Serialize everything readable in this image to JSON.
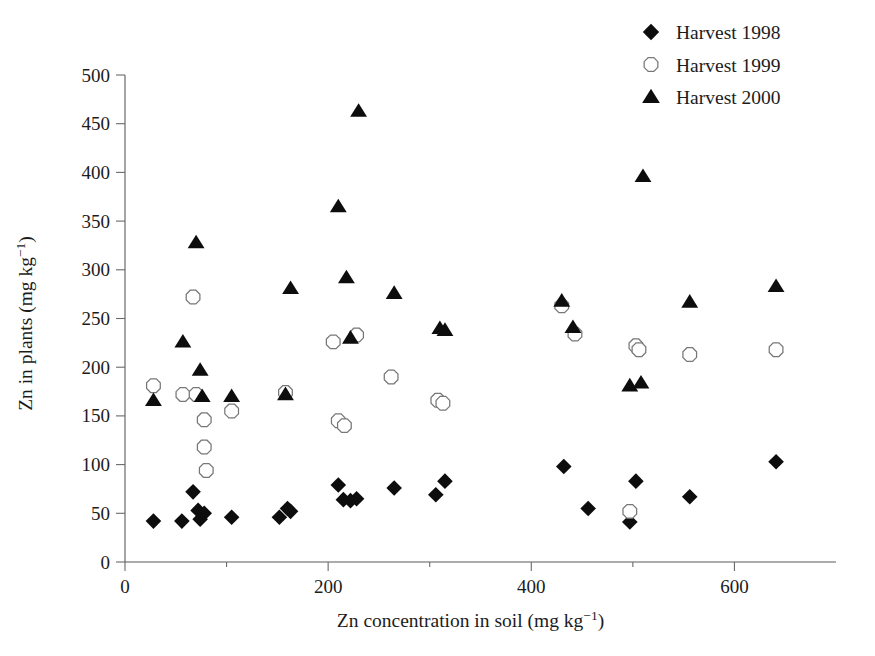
{
  "chart_data": {
    "type": "scatter",
    "title": "",
    "xlabel": "Zn concentration in soil (mg kg⁻¹)",
    "ylabel": "Zn in plants (mg kg⁻¹)",
    "xlim": [
      0,
      700
    ],
    "ylim": [
      0,
      500
    ],
    "xticks": [
      0,
      200,
      400,
      600
    ],
    "xtick_labels": [
      "0",
      "200",
      "400",
      "600"
    ],
    "xminor_ticks": [
      100,
      300,
      500
    ],
    "yticks": [
      0,
      50,
      100,
      150,
      200,
      250,
      300,
      350,
      400,
      450,
      500
    ],
    "ytick_labels": [
      "0",
      "50",
      "100",
      "150",
      "200",
      "250",
      "300",
      "350",
      "400",
      "450",
      "500"
    ],
    "grid": false,
    "legend_position": "top-right",
    "series": [
      {
        "name": "Harvest 1998",
        "marker": "filled-diamond",
        "color": "#0d0d0d",
        "points": [
          {
            "x": 28,
            "y": 42
          },
          {
            "x": 56,
            "y": 42
          },
          {
            "x": 67,
            "y": 72
          },
          {
            "x": 72,
            "y": 53
          },
          {
            "x": 74,
            "y": 44
          },
          {
            "x": 78,
            "y": 50
          },
          {
            "x": 105,
            "y": 46
          },
          {
            "x": 152,
            "y": 46
          },
          {
            "x": 160,
            "y": 55
          },
          {
            "x": 163,
            "y": 52
          },
          {
            "x": 210,
            "y": 79
          },
          {
            "x": 215,
            "y": 64
          },
          {
            "x": 222,
            "y": 63
          },
          {
            "x": 228,
            "y": 65
          },
          {
            "x": 265,
            "y": 76
          },
          {
            "x": 306,
            "y": 69
          },
          {
            "x": 315,
            "y": 83
          },
          {
            "x": 432,
            "y": 98
          },
          {
            "x": 456,
            "y": 55
          },
          {
            "x": 497,
            "y": 41
          },
          {
            "x": 503,
            "y": 83
          },
          {
            "x": 556,
            "y": 67
          },
          {
            "x": 641,
            "y": 103
          }
        ]
      },
      {
        "name": "Harvest 1999",
        "marker": "open-hexagon",
        "color": "#ffffff",
        "points": [
          {
            "x": 28,
            "y": 181
          },
          {
            "x": 57,
            "y": 172
          },
          {
            "x": 67,
            "y": 272
          },
          {
            "x": 70,
            "y": 172
          },
          {
            "x": 78,
            "y": 146
          },
          {
            "x": 78,
            "y": 118
          },
          {
            "x": 80,
            "y": 94
          },
          {
            "x": 105,
            "y": 155
          },
          {
            "x": 158,
            "y": 174
          },
          {
            "x": 205,
            "y": 226
          },
          {
            "x": 210,
            "y": 145
          },
          {
            "x": 216,
            "y": 140
          },
          {
            "x": 228,
            "y": 233
          },
          {
            "x": 262,
            "y": 190
          },
          {
            "x": 308,
            "y": 166
          },
          {
            "x": 313,
            "y": 163
          },
          {
            "x": 430,
            "y": 263
          },
          {
            "x": 443,
            "y": 234
          },
          {
            "x": 497,
            "y": 52
          },
          {
            "x": 503,
            "y": 222
          },
          {
            "x": 506,
            "y": 218
          },
          {
            "x": 556,
            "y": 213
          },
          {
            "x": 641,
            "y": 218
          }
        ]
      },
      {
        "name": "Harvest 2000",
        "marker": "filled-triangle",
        "color": "#0d0d0d",
        "points": [
          {
            "x": 28,
            "y": 166
          },
          {
            "x": 57,
            "y": 226
          },
          {
            "x": 70,
            "y": 328
          },
          {
            "x": 74,
            "y": 197
          },
          {
            "x": 76,
            "y": 170
          },
          {
            "x": 105,
            "y": 170
          },
          {
            "x": 158,
            "y": 172
          },
          {
            "x": 163,
            "y": 281
          },
          {
            "x": 210,
            "y": 365
          },
          {
            "x": 218,
            "y": 292
          },
          {
            "x": 222,
            "y": 230
          },
          {
            "x": 230,
            "y": 463
          },
          {
            "x": 265,
            "y": 276
          },
          {
            "x": 310,
            "y": 240
          },
          {
            "x": 315,
            "y": 238
          },
          {
            "x": 430,
            "y": 268
          },
          {
            "x": 441,
            "y": 241
          },
          {
            "x": 497,
            "y": 181
          },
          {
            "x": 508,
            "y": 184
          },
          {
            "x": 510,
            "y": 396
          },
          {
            "x": 556,
            "y": 267
          },
          {
            "x": 641,
            "y": 283
          }
        ]
      }
    ]
  },
  "legend": {
    "items": [
      {
        "label": "Harvest 1998",
        "marker": "filled-diamond"
      },
      {
        "label": "Harvest 1999",
        "marker": "open-hexagon"
      },
      {
        "label": "Harvest 2000",
        "marker": "filled-triangle"
      }
    ]
  },
  "axes": {
    "x_title_main": "Zn concentration in soil (mg kg",
    "x_title_sup": "−1",
    "x_title_tail": ")",
    "y_title_main": "Zn in plants (mg kg",
    "y_title_sup": "−1",
    "y_title_tail": ")"
  }
}
